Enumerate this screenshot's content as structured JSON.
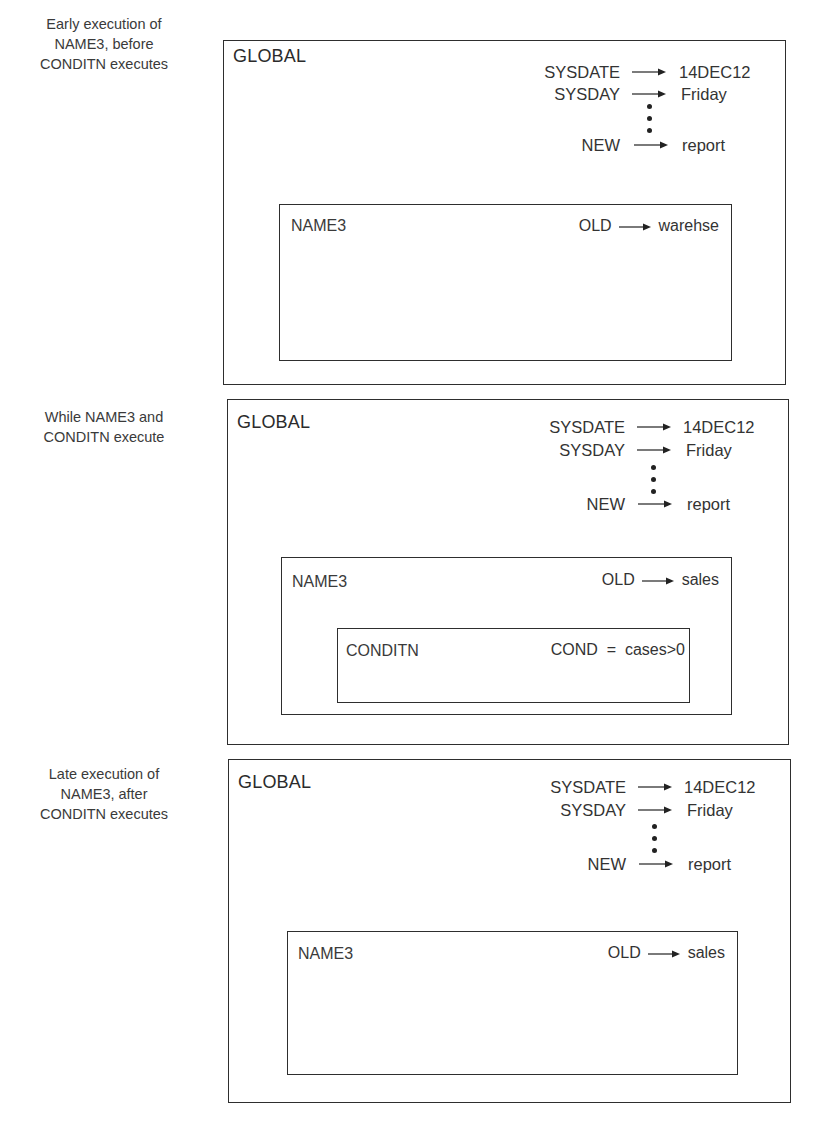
{
  "panels": [
    {
      "caption": [
        "Early execution of",
        "NAME3, before",
        "CONDITN executes"
      ],
      "global": {
        "title": "GLOBAL",
        "bindings": [
          {
            "name": "SYSDATE",
            "value": "14DEC12"
          },
          {
            "name": "SYSDAY",
            "value": "Friday"
          },
          {
            "name": "NEW",
            "value": "report"
          }
        ]
      },
      "local": {
        "title": "NAME3",
        "binding": {
          "name": "OLD",
          "value": "warehse"
        }
      }
    },
    {
      "caption": [
        "While NAME3 and",
        "CONDITN execute"
      ],
      "global": {
        "title": "GLOBAL",
        "bindings": [
          {
            "name": "SYSDATE",
            "value": "14DEC12"
          },
          {
            "name": "SYSDAY",
            "value": "Friday"
          },
          {
            "name": "NEW",
            "value": "report"
          }
        ]
      },
      "local": {
        "title": "NAME3",
        "binding": {
          "name": "OLD",
          "value": "sales"
        }
      },
      "nested": {
        "title": "CONDITN",
        "assignment": "COND  =  cases>0"
      }
    },
    {
      "caption": [
        "Late execution of",
        "NAME3, after",
        "CONDITN executes"
      ],
      "global": {
        "title": "GLOBAL",
        "bindings": [
          {
            "name": "SYSDATE",
            "value": "14DEC12"
          },
          {
            "name": "SYSDAY",
            "value": "Friday"
          },
          {
            "name": "NEW",
            "value": "report"
          }
        ]
      },
      "local": {
        "title": "NAME3",
        "binding": {
          "name": "OLD",
          "value": "sales"
        }
      }
    }
  ],
  "icons": {
    "arrow": "right-arrow-icon",
    "ellipsis": "vertical-ellipsis-icon"
  }
}
